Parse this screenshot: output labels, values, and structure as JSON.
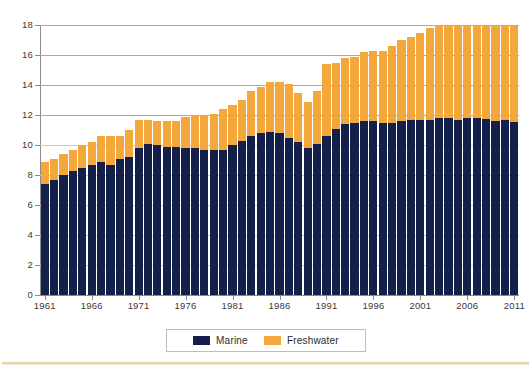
{
  "chart_data": {
    "type": "bar",
    "stacked": true,
    "title": "",
    "subtitle": "",
    "xlabel": "",
    "ylabel": "",
    "ylim": [
      0,
      18
    ],
    "ytick_values": [
      0,
      2,
      4,
      6,
      8,
      10,
      12,
      14,
      16,
      18
    ],
    "ytick_labels": [
      "0",
      "2",
      "4",
      "6",
      "8",
      "10",
      "12",
      "14",
      "16",
      "18"
    ],
    "grid": true,
    "legend_position": "bottom-center",
    "categories": [
      "1961",
      "1962",
      "1963",
      "1964",
      "1965",
      "1966",
      "1967",
      "1968",
      "1969",
      "1970",
      "1971",
      "1972",
      "1973",
      "1974",
      "1975",
      "1976",
      "1977",
      "1978",
      "1979",
      "1980",
      "1981",
      "1982",
      "1983",
      "1984",
      "1985",
      "1986",
      "1987",
      "1988",
      "1989",
      "1990",
      "1991",
      "1992",
      "1993",
      "1994",
      "1995",
      "1996",
      "1997",
      "1998",
      "1999",
      "2000",
      "2001",
      "2002",
      "2003",
      "2004",
      "2005",
      "2006",
      "2007",
      "2008",
      "2009",
      "2010",
      "2011"
    ],
    "xtick_labels": [
      "1961",
      "1966",
      "1971",
      "1976",
      "1981",
      "1986",
      "1991",
      "1996",
      "2001",
      "2006",
      "2011"
    ],
    "series": [
      {
        "name": "Marine",
        "color": "#14204a",
        "values": [
          7.4,
          7.7,
          8.0,
          8.3,
          8.5,
          8.7,
          8.9,
          8.7,
          9.1,
          9.2,
          9.8,
          10.1,
          10.0,
          9.9,
          9.9,
          9.8,
          9.8,
          9.7,
          9.7,
          9.7,
          10.0,
          10.3,
          10.6,
          10.8,
          10.9,
          10.8,
          10.5,
          10.2,
          9.8,
          10.1,
          10.6,
          11.1,
          11.4,
          11.5,
          11.6,
          11.6,
          11.5,
          11.5,
          11.6,
          11.7,
          11.7,
          11.7,
          11.8,
          11.9,
          11.9,
          12.0,
          12.1,
          12.1,
          12.0,
          12.0,
          12.0
        ]
      },
      {
        "name": "Freshwater",
        "color": "#f4a83c",
        "values": [
          1.5,
          1.4,
          1.4,
          1.4,
          1.5,
          1.5,
          1.7,
          1.9,
          1.5,
          1.8,
          1.9,
          1.6,
          1.6,
          1.7,
          1.7,
          2.1,
          2.2,
          2.3,
          2.4,
          2.7,
          2.7,
          2.7,
          3.0,
          3.1,
          3.3,
          3.4,
          3.6,
          3.3,
          3.1,
          3.5,
          4.8,
          4.4,
          4.4,
          4.4,
          4.6,
          4.7,
          4.8,
          5.1,
          5.4,
          5.5,
          5.8,
          6.1,
          6.2,
          6.3,
          6.5,
          6.3,
          6.4,
          6.5,
          6.6,
          6.5,
          6.7
        ]
      }
    ],
    "totals": [
      8.9,
      9.1,
      9.4,
      9.7,
      10.0,
      10.2,
      10.6,
      10.6,
      10.6,
      11.0,
      11.7,
      11.7,
      11.6,
      11.6,
      11.6,
      11.9,
      12.0,
      12.0,
      12.1,
      12.4,
      12.7,
      13.0,
      13.6,
      13.9,
      14.2,
      14.2,
      14.1,
      13.5,
      12.9,
      13.6,
      15.4,
      15.5,
      15.8,
      15.9,
      16.2,
      16.3,
      16.3,
      16.6,
      17.0,
      17.2,
      17.5,
      17.8,
      18.0,
      18.2,
      18.4,
      18.3,
      18.5,
      18.6,
      18.6,
      18.5,
      18.7
    ]
  },
  "legend": {
    "items": [
      {
        "label": "Marine",
        "color": "#14204a"
      },
      {
        "label": "Freshwater",
        "color": "#f4a83c"
      }
    ]
  },
  "colors": {
    "marine": "#14204a",
    "freshwater": "#f4a83c",
    "gridline": "#a9a9a9",
    "axis": "#8c8c8c",
    "tick_text": "#3a3a3a",
    "rule": "#e8d3ae",
    "background": "#ffffff"
  }
}
